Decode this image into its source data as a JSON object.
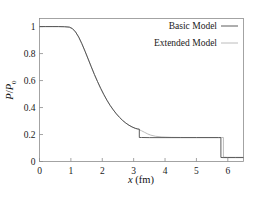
{
  "chart_data": {
    "type": "line",
    "title": "",
    "xlabel": "x (fm)",
    "ylabel": "P/P0",
    "xlabel_italic_part": "x",
    "xlabel_rest": " (fm)",
    "ylabel_numerator": "P",
    "ylabel_denominator": "P",
    "ylabel_subscript": "0",
    "xlim": [
      0,
      6.5
    ],
    "ylim": [
      0,
      1.06
    ],
    "xticks": [
      0,
      1,
      2,
      3,
      4,
      5,
      6
    ],
    "xtick_labels": [
      "0",
      "1",
      "2",
      "3",
      "4",
      "5",
      "6"
    ],
    "yticks": [
      0,
      0.2,
      0.4,
      0.6,
      0.8,
      1
    ],
    "ytick_labels": [
      "0",
      "0.2",
      "0.4",
      "0.6",
      "0.8",
      "1"
    ],
    "grid": false,
    "legend_position": "top-right",
    "legend": [
      {
        "name": "Basic Model",
        "color": "#4a4a4a"
      },
      {
        "name": "Extended Model",
        "color": "#b4b4b4"
      }
    ],
    "series": [
      {
        "name": "Basic Model",
        "color": "#4a4a4a",
        "width": 0.9,
        "x": [
          0.0,
          0.2,
          0.4,
          0.6,
          0.8,
          0.95,
          1.05,
          1.15,
          1.25,
          1.35,
          1.45,
          1.55,
          1.65,
          1.75,
          1.85,
          1.95,
          2.05,
          2.15,
          2.25,
          2.35,
          2.45,
          2.55,
          2.65,
          2.75,
          2.85,
          2.95,
          3.05,
          3.12,
          3.18,
          3.18,
          3.25,
          3.5,
          4.0,
          4.5,
          5.0,
          5.4,
          5.7,
          5.78,
          5.78,
          5.85,
          6.0,
          6.25,
          6.5
        ],
        "y": [
          1.0,
          1.0,
          1.0,
          1.0,
          0.999,
          0.996,
          0.985,
          0.96,
          0.922,
          0.873,
          0.818,
          0.76,
          0.702,
          0.645,
          0.592,
          0.542,
          0.496,
          0.454,
          0.416,
          0.383,
          0.353,
          0.327,
          0.304,
          0.285,
          0.269,
          0.256,
          0.246,
          0.242,
          0.24,
          0.178,
          0.178,
          0.177,
          0.177,
          0.177,
          0.177,
          0.177,
          0.177,
          0.177,
          0.03,
          0.029,
          0.029,
          0.029,
          0.029
        ]
      },
      {
        "name": "Extended Model",
        "color": "#b4b4b4",
        "width": 0.9,
        "x": [
          0.0,
          0.2,
          0.4,
          0.6,
          0.8,
          0.95,
          1.05,
          1.15,
          1.25,
          1.35,
          1.45,
          1.55,
          1.65,
          1.75,
          1.85,
          1.95,
          2.05,
          2.15,
          2.25,
          2.35,
          2.45,
          2.55,
          2.65,
          2.75,
          2.85,
          2.95,
          3.05,
          3.15,
          3.25,
          3.35,
          3.45,
          3.55,
          3.7,
          3.9,
          4.2,
          4.6,
          5.0,
          5.4,
          5.7,
          5.8,
          5.86,
          5.86,
          5.95,
          6.1,
          6.3,
          6.5
        ],
        "y": [
          1.0,
          1.0,
          1.0,
          1.0,
          0.999,
          0.996,
          0.985,
          0.96,
          0.922,
          0.873,
          0.818,
          0.76,
          0.702,
          0.645,
          0.592,
          0.542,
          0.496,
          0.454,
          0.416,
          0.383,
          0.353,
          0.327,
          0.304,
          0.285,
          0.269,
          0.256,
          0.246,
          0.238,
          0.228,
          0.216,
          0.204,
          0.195,
          0.187,
          0.182,
          0.179,
          0.178,
          0.178,
          0.178,
          0.178,
          0.178,
          0.178,
          0.032,
          0.031,
          0.031,
          0.031,
          0.031
        ]
      }
    ]
  },
  "axes": {
    "x_title_italic": "x",
    "x_title_rest": "(fm)",
    "y_title_p": "P",
    "y_title_slash": "/",
    "y_title_p2": "P",
    "y_title_sub": "0"
  },
  "legend": {
    "entries": [
      {
        "label": "Basic Model"
      },
      {
        "label": "Extended Model"
      }
    ]
  },
  "ticks": {
    "x": [
      "0",
      "1",
      "2",
      "3",
      "4",
      "5",
      "6"
    ],
    "y": [
      "0",
      "0.2",
      "0.4",
      "0.6",
      "0.8",
      "1"
    ]
  },
  "colors": {
    "basic": "#4a4a4a",
    "extended": "#b4b4b4",
    "frame": "#8d8d8d",
    "text": "#1a1a1a",
    "background": "#ffffff"
  }
}
